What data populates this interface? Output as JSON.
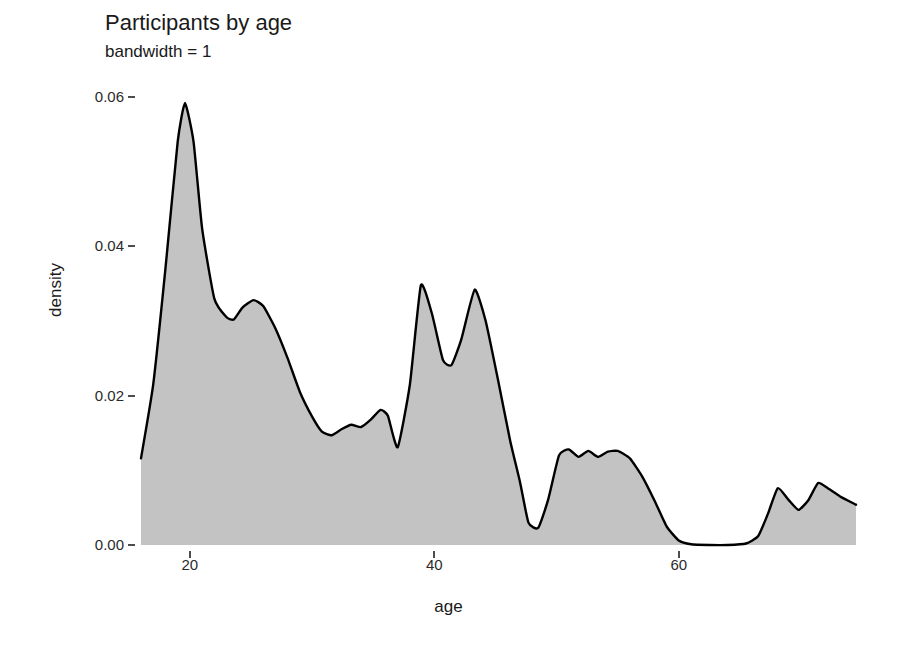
{
  "chart_data": {
    "type": "area",
    "title": "Participants by age",
    "subtitle": "bandwidth = 1",
    "xlabel": "age",
    "ylabel": "density",
    "grid": false,
    "legend": "none",
    "xlim": [
      16.0,
      74.5
    ],
    "ylim": [
      0.0,
      0.0625
    ],
    "xticks": [
      20,
      40,
      60
    ],
    "xtick_labels": [
      "20",
      "40",
      "60"
    ],
    "yticks": [
      0.0,
      0.02,
      0.04,
      0.06
    ],
    "ytick_labels": [
      "0.00",
      "0.02",
      "0.04",
      "0.06"
    ],
    "fill_color": "#c3c3c3",
    "line_color": "#000000",
    "x": [
      16.0,
      17.0,
      18.0,
      19.0,
      19.6,
      20.3,
      21.0,
      22.0,
      23.0,
      23.6,
      24.3,
      25.2,
      26.0,
      27.0,
      28.0,
      29.0,
      30.0,
      30.8,
      31.6,
      32.4,
      33.2,
      34.0,
      34.8,
      35.6,
      36.2,
      37.0,
      38.0,
      38.9,
      39.8,
      40.7,
      41.4,
      42.2,
      43.3,
      44.2,
      45.2,
      46.2,
      47.0,
      47.7,
      48.5,
      49.3,
      50.2,
      51.0,
      51.8,
      52.6,
      53.4,
      54.2,
      55.0,
      56.0,
      57.0,
      58.0,
      59.0,
      60.0,
      61.0,
      62.5,
      64.0,
      65.5,
      66.5,
      67.3,
      68.1,
      69.0,
      69.8,
      70.6,
      71.4,
      72.2,
      73.2,
      74.5
    ],
    "y": [
      0.0116,
      0.0215,
      0.037,
      0.054,
      0.0592,
      0.054,
      0.0424,
      0.033,
      0.0305,
      0.0302,
      0.0318,
      0.0328,
      0.032,
      0.029,
      0.025,
      0.0205,
      0.0172,
      0.0152,
      0.0147,
      0.0155,
      0.0161,
      0.0158,
      0.0168,
      0.0181,
      0.0173,
      0.0131,
      0.0215,
      0.0348,
      0.031,
      0.0248,
      0.0241,
      0.0275,
      0.0342,
      0.03,
      0.0222,
      0.014,
      0.0085,
      0.003,
      0.0023,
      0.006,
      0.012,
      0.0128,
      0.0118,
      0.0126,
      0.0118,
      0.0125,
      0.0126,
      0.0116,
      0.0092,
      0.006,
      0.0025,
      0.0006,
      0.0001,
      0.0,
      0.0,
      0.0002,
      0.0012,
      0.0042,
      0.0076,
      0.006,
      0.0047,
      0.006,
      0.0083,
      0.0076,
      0.0065,
      0.0054
    ]
  }
}
